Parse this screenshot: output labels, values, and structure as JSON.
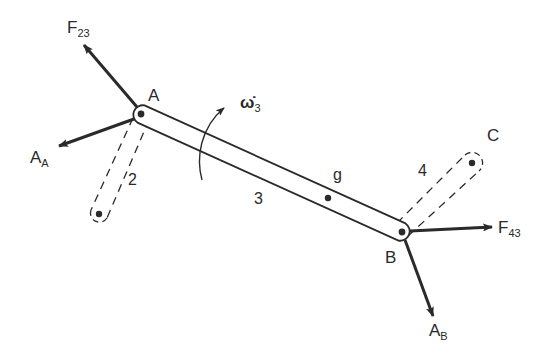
{
  "diagram": {
    "type": "free-body diagram of four-bar linkage coupler",
    "points": {
      "A": {
        "label": "A",
        "x": 141,
        "y": 114
      },
      "B": {
        "label": "B",
        "x": 402,
        "y": 232
      },
      "C": {
        "label": "C",
        "x": 472,
        "y": 163
      },
      "O2": {
        "x": 99,
        "y": 214
      },
      "g": {
        "label": "g",
        "x": 328,
        "y": 198
      }
    },
    "links": [
      {
        "id": "2",
        "label": "2",
        "style": "dashed",
        "from": "A",
        "to": "O2"
      },
      {
        "id": "3",
        "label": "3",
        "style": "solid",
        "from": "A",
        "to": "B"
      },
      {
        "id": "4",
        "label": "4",
        "style": "dashed",
        "from": "B",
        "to": "C"
      }
    ],
    "forces": [
      {
        "name": "F23",
        "main": "F",
        "sub": "23",
        "at": "A",
        "tip": [
          83,
          43
        ]
      },
      {
        "name": "AA",
        "main": "A",
        "sub": "A",
        "at": "A",
        "tip": [
          57,
          147
        ]
      },
      {
        "name": "F43",
        "main": "F",
        "sub": "43",
        "at": "B",
        "tip": [
          494,
          227
        ]
      },
      {
        "name": "AB",
        "main": "A",
        "sub": "B",
        "at": "B",
        "tip": [
          434,
          318
        ]
      }
    ],
    "angular_acceleration": {
      "symbol": "ω̇",
      "sub": "3",
      "direction": "counterclockwise"
    },
    "colors": {
      "ink": "#2a2a2a",
      "background": "#ffffff"
    }
  }
}
